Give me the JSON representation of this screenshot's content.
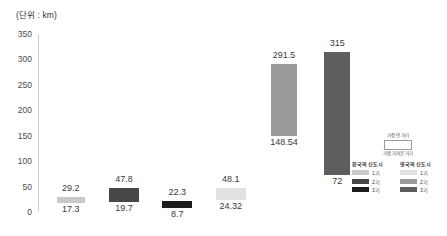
{
  "unit_caption": "(단위 : km)",
  "chart_data": {
    "type": "bar",
    "subtype": "floating-range-bar",
    "title": "",
    "subtitle": "",
    "xlabel": "",
    "ylabel": "",
    "unit": "km",
    "unit_caption": "(단위 : km)",
    "ylim": [
      0,
      350
    ],
    "yticks": [
      0,
      50,
      100,
      150,
      200,
      250,
      300,
      350
    ],
    "ytick_labels": [
      "0",
      "50",
      "100",
      "150",
      "200",
      "250",
      "300",
      "350"
    ],
    "grid": false,
    "legend_position": "right-bottom",
    "categories": [
      "1",
      "2",
      "3",
      "4",
      "5",
      "6"
    ],
    "series": [
      {
        "name": "가장 먼 거리",
        "values": [
          29.2,
          47.8,
          22.3,
          48.1,
          291.5,
          315
        ]
      },
      {
        "name": "가장 가까운 거리",
        "values": [
          17.3,
          19.7,
          8.7,
          24.32,
          148.54,
          72
        ]
      }
    ],
    "bars": [
      {
        "top": 29.2,
        "bottom": 17.3,
        "top_label": "29.2",
        "bottom_label": "17.3",
        "color": "#c9c9c9",
        "group": "한국의 신도시",
        "phase": "1기"
      },
      {
        "top": 47.8,
        "bottom": 19.7,
        "top_label": "47.8",
        "bottom_label": "19.7",
        "color": "#474747",
        "group": "한국의 신도시",
        "phase": "2기"
      },
      {
        "top": 22.3,
        "bottom": 8.7,
        "top_label": "22.3",
        "bottom_label": "8.7",
        "color": "#1c1c1c",
        "group": "한국의 신도시",
        "phase": "3기"
      },
      {
        "top": 48.1,
        "bottom": 24.32,
        "top_label": "48.1",
        "bottom_label": "24.32",
        "color": "#e2e2e2",
        "group": "영국의 신도시",
        "phase": "1기"
      },
      {
        "top": 291.5,
        "bottom": 148.54,
        "top_label": "291.5",
        "bottom_label": "148.54",
        "color": "#9a9a9a",
        "group": "영국의 신도시",
        "phase": "2기"
      },
      {
        "top": 315,
        "bottom": 72,
        "top_label": "315",
        "bottom_label": "72",
        "color": "#5e5e5e",
        "group": "영국의 신도시",
        "phase": "3기"
      }
    ]
  },
  "legend": {
    "range_top_label": "가장 먼 거리",
    "range_bottom_label": "가장 가까운 거리",
    "columns": [
      {
        "title": "한국의 신도시",
        "rows": [
          {
            "label": "1기",
            "color": "#c9c9c9"
          },
          {
            "label": "2기",
            "color": "#474747"
          },
          {
            "label": "3기",
            "color": "#1c1c1c"
          }
        ]
      },
      {
        "title": "영국의 신도시",
        "rows": [
          {
            "label": "1기",
            "color": "#e2e2e2"
          },
          {
            "label": "2기",
            "color": "#9a9a9a"
          },
          {
            "label": "3기",
            "color": "#5e5e5e"
          }
        ]
      }
    ]
  }
}
